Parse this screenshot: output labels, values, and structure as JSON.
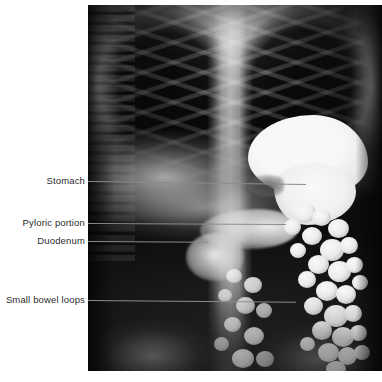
{
  "figure": {
    "type": "annotated-radiograph",
    "modality": "barium-meal-abdominal-x-ray",
    "background_color": "#ffffff",
    "plate": {
      "left": 88,
      "top": 5,
      "width": 294,
      "height": 366,
      "film_color": "#000000"
    }
  },
  "annotations": [
    {
      "id": "stomach",
      "label": "Stomach",
      "label_right": 85,
      "label_top": 175,
      "line_x": 88,
      "line_y": 181,
      "line_length": 218,
      "line_angle": 0.8,
      "color": "#8c8c8c"
    },
    {
      "id": "pyloric-portion",
      "label": "Pyloric portion",
      "label_right": 85,
      "label_top": 217,
      "line_x": 88,
      "line_y": 223,
      "line_length": 198,
      "line_angle": 0.3,
      "color": "#8c8c8c"
    },
    {
      "id": "duodenum",
      "label": "Duodenum",
      "label_right": 85,
      "label_top": 235,
      "line_x": 88,
      "line_y": 241,
      "line_length": 120,
      "line_angle": 0.3,
      "color": "#8c8c8c"
    },
    {
      "id": "small-bowel-loops",
      "label": "Small bowel loops",
      "label_right": 85,
      "label_top": 294,
      "line_x": 88,
      "line_y": 300,
      "line_length": 208,
      "line_angle": 0.5,
      "color": "#8c8c8c"
    }
  ],
  "anatomy_regions": [
    {
      "id": "lung-fields",
      "label": "Lung fields"
    },
    {
      "id": "rib-cage",
      "label": "Rib cage"
    },
    {
      "id": "vertebral-column",
      "label": "Vertebral column"
    },
    {
      "id": "diaphragm",
      "label": "Diaphragm"
    },
    {
      "id": "stomach-fundus",
      "label": "Gastric fundus"
    },
    {
      "id": "stomach-body",
      "label": "Gastric body"
    },
    {
      "id": "incisura",
      "label": "Incisura angularis"
    },
    {
      "id": "pyloric-antrum",
      "label": "Pyloric antrum"
    },
    {
      "id": "duodenal-cap",
      "label": "Duodenal cap"
    },
    {
      "id": "jejunal-loops",
      "label": "Jejunal loops"
    },
    {
      "id": "pelvis",
      "label": "Pelvic bones"
    }
  ]
}
